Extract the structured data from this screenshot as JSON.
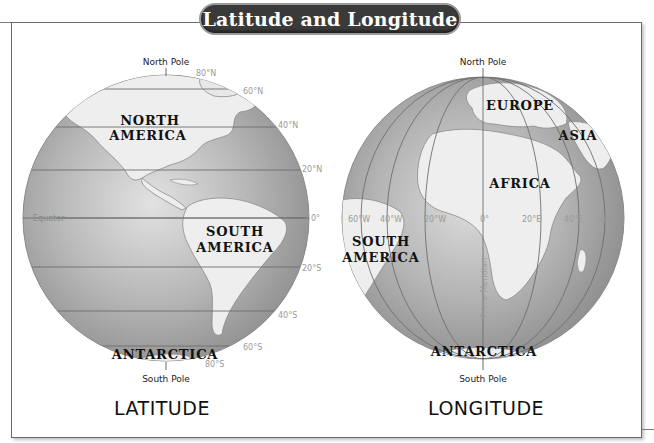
{
  "title": "Latitude and Longitude",
  "latitude_globe": {
    "caption": "LATITUDE",
    "north_pole": "North Pole",
    "south_pole": "South Pole",
    "equator_label": "Equator",
    "parallels": [
      "80°N",
      "60°N",
      "40°N",
      "20°N",
      "0°",
      "20°S",
      "40°S",
      "60°S",
      "80°S"
    ],
    "regions": {
      "north_america_line1": "NORTH",
      "north_america_line2": "AMERICA",
      "south_america_line1": "SOUTH",
      "south_america_line2": "AMERICA",
      "antarctica": "ANTARCTICA"
    }
  },
  "longitude_globe": {
    "caption": "LONGITUDE",
    "north_pole": "North Pole",
    "south_pole": "South Pole",
    "prime_meridian_label": "Prime Meridian",
    "meridians": [
      "60°W",
      "40°W",
      "20°W",
      "0°",
      "20°E",
      "40°E",
      "60°E"
    ],
    "regions": {
      "europe": "EUROPE",
      "asia": "ASIA",
      "africa": "AFRICA",
      "south_america_line1": "SOUTH",
      "south_america_line2": "AMERICA",
      "antarctica": "ANTARCTICA"
    }
  },
  "colors": {
    "ocean": "#a9a9a9",
    "land": "#efefef",
    "grid_line": "#6e6e6e",
    "title_bg": "#3a3a3a",
    "label_gray": "#9a9a9a"
  }
}
